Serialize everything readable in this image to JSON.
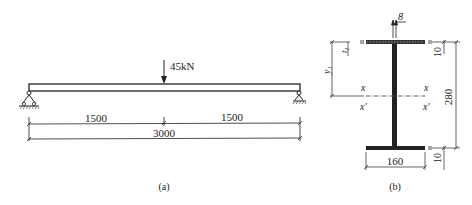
{
  "figure_a": {
    "load_label": "45kN",
    "dims": {
      "left_span": "1500",
      "right_span": "1500",
      "total": "3000"
    },
    "caption": "(a)"
  },
  "figure_b": {
    "top_label": "8",
    "t1_label": "t",
    "t1_sub": "1",
    "y1_label": "y",
    "y1_sub": "1",
    "axis_x_left": "x",
    "axis_x_right": "x",
    "axis_xp_left": "x′",
    "axis_xp_right": "x′",
    "top_flange_thk": "10",
    "height": "280",
    "bottom_flange_thk": "10",
    "width": "160",
    "caption": "(b)"
  }
}
